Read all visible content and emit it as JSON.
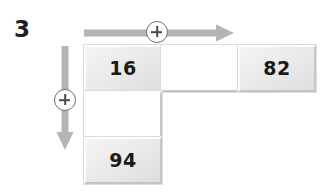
{
  "page": {
    "question_number": "3",
    "background_color": "#ffffff"
  },
  "operators": {
    "horizontal": {
      "symbol": "+",
      "direction": "right",
      "icon": "plus-in-circle-icon",
      "arrow_color": "#b4b4b4"
    },
    "vertical": {
      "symbol": "+",
      "direction": "down",
      "icon": "plus-in-circle-icon",
      "arrow_color": "#b4b4b4"
    }
  },
  "grid": {
    "rows": [
      {
        "cells": [
          {
            "value": "16",
            "state": "filled"
          },
          {
            "value": "",
            "state": "blank"
          },
          {
            "value": "82",
            "state": "filled"
          }
        ]
      },
      {
        "cells": [
          {
            "value": "",
            "state": "blank"
          }
        ]
      },
      {
        "cells": [
          {
            "value": "94",
            "state": "filled"
          }
        ]
      }
    ]
  },
  "colors": {
    "cell_fill": "#ebebeb",
    "cell_blank": "#ffffff",
    "cell_border_light": "#fdfdfd",
    "cell_border_dark": "#c6c6c6",
    "text": "#1a1a1a",
    "arrow": "#b4b4b4",
    "badge_outline": "#6f6f6f"
  }
}
